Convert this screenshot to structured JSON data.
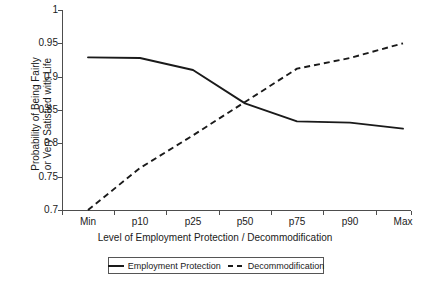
{
  "chart_data": {
    "type": "line",
    "title": "",
    "xlabel": "Level of Employment Protection / Decommodification",
    "ylabel_lines": [
      "Probability of Being Fairly",
      "or Very Satisfied with Life"
    ],
    "ylabel": "Probability of Being Fairly or Very Satisfied with Life",
    "categories": [
      "Min",
      "p10",
      "p25",
      "p50",
      "p75",
      "p90",
      "Max"
    ],
    "ylim": [
      0.7,
      1
    ],
    "yticks": [
      0.7,
      0.75,
      0.8,
      0.85,
      0.9,
      0.95,
      1
    ],
    "ytick_labels": [
      "0.7",
      "0.75",
      "0.8",
      "0.85",
      "0.9",
      "0.95",
      "1"
    ],
    "grid": false,
    "legend_position": "bottom",
    "series": [
      {
        "name": "Employment Protection",
        "style": "solid",
        "color": "#1a1a1a",
        "values": [
          0.929,
          0.928,
          0.91,
          0.86,
          0.833,
          0.831,
          0.822
        ]
      },
      {
        "name": "Decommodification",
        "style": "dashed",
        "color": "#1a1a1a",
        "values": [
          0.7,
          0.763,
          0.812,
          0.862,
          0.912,
          0.928,
          0.95
        ]
      }
    ]
  },
  "legend": {
    "items": [
      {
        "label": "Employment Protection",
        "style": "solid"
      },
      {
        "label": "Decommodification",
        "style": "dashed"
      }
    ]
  }
}
